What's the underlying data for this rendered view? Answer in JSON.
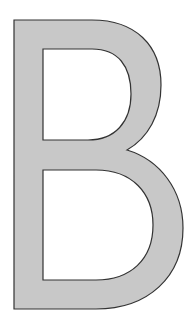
{
  "glyph": {
    "character": "B",
    "fill_color": "#c8c8c8",
    "stroke_color": "#333333",
    "background_color": "#ffffff"
  }
}
